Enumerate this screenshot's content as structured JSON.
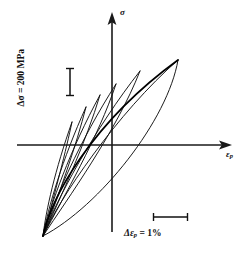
{
  "figure": {
    "kind": "cyclic-stress-strain-hysteresis-loops",
    "background_color": "#ffffff",
    "line_color": "#111111"
  },
  "axes": {
    "vertical": {
      "label": "σ",
      "name": "stress-axis",
      "x": 112,
      "y_top": 14,
      "y_bottom": 232
    },
    "horizontal": {
      "label_main": "ε",
      "label_sub": "p",
      "name": "plastic-strain-axis",
      "y": 145,
      "x_left": 17,
      "x_right": 231
    }
  },
  "annotations": {
    "stress_scale": {
      "text_prefix": "Δσ",
      "text_full": "Δσ = 200 MPa",
      "value": 200,
      "unit": "MPa",
      "bar_x": 70,
      "bar_y_top": 68,
      "bar_y_bottom": 96
    },
    "strain_scale": {
      "text_full": "Δεp = 1%",
      "value": 1,
      "unit": "%",
      "bar_x_left": 153,
      "bar_x_right": 188,
      "bar_y": 217
    }
  },
  "chart_data": {
    "type": "line",
    "title": "",
    "xlabel": "εp",
    "ylabel": "σ",
    "grid": false,
    "legend": false,
    "common_origin": [
      43,
      236
    ],
    "scale_reference": {
      "stress_bar_pixels": 28,
      "stress_bar_value": 200,
      "stress_bar_unit": "MPa",
      "strain_bar_pixels": 35,
      "strain_bar_value": 1,
      "strain_bar_unit": "%"
    },
    "series": [
      {
        "name": "loop-1-smallest",
        "upper_tip": [
          72,
          122
        ],
        "unload_path": "M 43 236 C 46 210 55 170 72 122",
        "reload_path": "M 72 122 C 66 150 56 190 43 236"
      },
      {
        "name": "loop-2",
        "upper_tip": [
          86,
          107
        ],
        "unload_path": "M 43 236 C 48 208 62 160 86 107",
        "reload_path": "M 86 107 C 76 146 60 192 43 236"
      },
      {
        "name": "loop-3",
        "upper_tip": [
          100,
          95
        ],
        "unload_path": "M 43 236 C 50 206 70 150 100 95",
        "reload_path": "M 100 95 C 86 142 62 194 43 236"
      },
      {
        "name": "loop-4",
        "upper_tip": [
          116,
          84
        ],
        "unload_path": "M 43 236 C 52 204 80 140 116 84",
        "reload_path": "M 116 84 C 98 138 64 196 43 236"
      },
      {
        "name": "loop-5",
        "upper_tip": [
          140,
          71
        ],
        "unload_path": "M 43 236 C 55 202 95 128 140 71",
        "reload_path": "M 140 71 C 116 132 68 198 43 236"
      },
      {
        "name": "loop-6-largest",
        "upper_tip": [
          178,
          60
        ],
        "unload_path": "M 43 236 C 58 200 118 112 178 60",
        "reload_path": "M 178 60 C 168 120 100 206 43 236"
      }
    ],
    "envelope": {
      "name": "cyclic-stress-strain-envelope",
      "path": "M 43 236 C 50 200 90 124 178 60",
      "note": "Bold monotonic envelope through the upper tips of all loops"
    }
  }
}
